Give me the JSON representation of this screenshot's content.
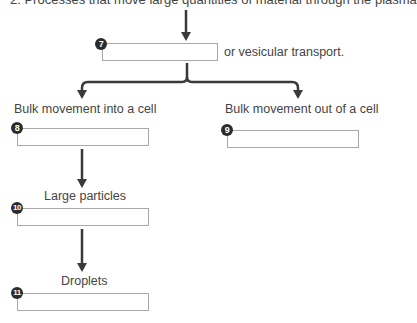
{
  "diagram": {
    "title": "2. Processes that move large quantities of material through the plasma",
    "top_node": {
      "number": "7",
      "answer": "",
      "suffix": "or vesicular transport."
    },
    "branches": [
      {
        "label": "Bulk movement into a cell",
        "number": "8",
        "answer": ""
      },
      {
        "label": "Bulk movement out of a cell",
        "number": "9",
        "answer": ""
      }
    ],
    "left_chain": [
      {
        "label": "Large particles",
        "number": "10",
        "answer": ""
      },
      {
        "label": "Droplets",
        "number": "11",
        "answer": ""
      }
    ],
    "colors": {
      "arrow": "#3a3a3a",
      "box_border": "#a8a8a8",
      "badge": "#2b2b2b",
      "text": "#444444"
    }
  }
}
